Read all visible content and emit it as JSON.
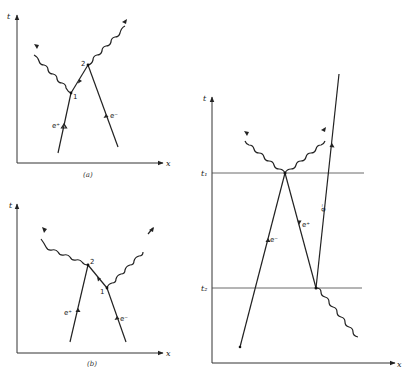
{
  "figure": {
    "panel_a": {
      "caption": "(a)",
      "t_axis_label": "t",
      "x_axis_label": "x",
      "vertex_1_label": "1",
      "vertex_2_label": "2",
      "positron_label": "e⁺",
      "electron_label": "e⁻"
    },
    "panel_b": {
      "caption": "(b)",
      "t_axis_label": "t",
      "x_axis_label": "x",
      "vertex_1_label": "1",
      "vertex_2_label": "2",
      "positron_label": "e⁺",
      "electron_label": "e⁻"
    },
    "panel_c": {
      "t_axis_label": "t",
      "x_axis_label": "x",
      "t1_label": "t₁",
      "t2_label": "t₂",
      "left_line_label": "e⁻",
      "middle_line_label": "e⁺",
      "right_line_label": "e⁻"
    }
  }
}
